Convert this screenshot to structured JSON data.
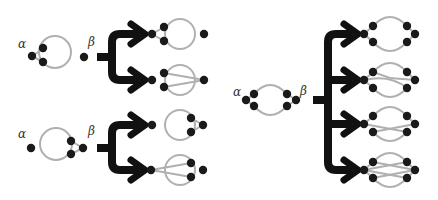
{
  "colors": {
    "background": "#ffffff",
    "node": "#1a1a1a",
    "edge": "#b0b0b0",
    "arrow": "#111111",
    "label": "#333333"
  },
  "labels": {
    "alpha": "α",
    "beta": "β"
  },
  "panels": [
    {
      "id": "top-left",
      "source": {
        "alpha_label": {
          "x": 18,
          "y": 38
        },
        "beta_label": {
          "x": 88,
          "y": 36
        },
        "circles": [
          {
            "cx": 55,
            "cy": 52,
            "r": 16
          }
        ],
        "lines": [
          [
            32,
            56,
            43,
            49
          ],
          [
            32,
            56,
            43,
            62
          ]
        ],
        "nodes": [
          [
            32,
            56
          ],
          [
            43,
            48
          ],
          [
            43,
            62
          ],
          [
            84,
            57
          ]
        ]
      },
      "bracket": {
        "stem_x1": 97,
        "stem_y": 57,
        "vx": 112,
        "y_top": 34,
        "y_bot": 80,
        "arrow_x": 145,
        "targets_y": [
          34,
          80
        ]
      },
      "results": [
        {
          "circles": [
            {
              "cx": 180,
              "cy": 34,
              "r": 15
            }
          ],
          "lines": [
            [
              152,
              34,
              164,
              27
            ],
            [
              152,
              34,
              164,
              41
            ]
          ],
          "nodes": [
            [
              152,
              34
            ],
            [
              164,
              27
            ],
            [
              164,
              41
            ],
            [
              204,
              34
            ]
          ]
        },
        {
          "circles": [
            {
              "cx": 180,
              "cy": 80,
              "r": 15
            }
          ],
          "lines": [
            [
              164,
              73,
              204,
              80
            ],
            [
              164,
              87,
              204,
              80
            ]
          ],
          "nodes": [
            [
              152,
              80
            ],
            [
              164,
              73
            ],
            [
              164,
              87
            ],
            [
              204,
              80
            ]
          ]
        }
      ]
    },
    {
      "id": "bottom-left",
      "source": {
        "alpha_label": {
          "x": 18,
          "y": 130
        },
        "beta_label": {
          "x": 88,
          "y": 128
        },
        "circles": [
          {
            "cx": 56,
            "cy": 144,
            "r": 16
          }
        ],
        "lines": [
          [
            71,
            141,
            83,
            148
          ],
          [
            71,
            154,
            83,
            148
          ]
        ],
        "nodes": [
          [
            31,
            148
          ],
          [
            71,
            141
          ],
          [
            71,
            154
          ],
          [
            83,
            148
          ]
        ]
      },
      "bracket": {
        "stem_x1": 97,
        "stem_y": 148,
        "vx": 112,
        "y_top": 125,
        "y_bot": 170,
        "arrow_x": 145,
        "targets_y": [
          125,
          170
        ]
      },
      "results": [
        {
          "circles": [
            {
              "cx": 180,
              "cy": 125,
              "r": 15
            }
          ],
          "lines": [
            [
              191,
              118,
              203,
              125
            ],
            [
              191,
              132,
              203,
              125
            ]
          ],
          "nodes": [
            [
              152,
              125
            ],
            [
              191,
              118
            ],
            [
              191,
              132
            ],
            [
              203,
              125
            ]
          ]
        },
        {
          "circles": [
            {
              "cx": 180,
              "cy": 170,
              "r": 15
            }
          ],
          "lines": [
            [
              151,
              170,
              191,
              163
            ],
            [
              151,
              170,
              191,
              177
            ]
          ],
          "nodes": [
            [
              151,
              170
            ],
            [
              191,
              163
            ],
            [
              191,
              177
            ],
            [
              203,
              170
            ]
          ]
        }
      ]
    },
    {
      "id": "right",
      "source": {
        "alpha_label": {
          "x": 233,
          "y": 86
        },
        "beta_label": {
          "x": 300,
          "y": 86
        },
        "arcs": [
          "M 254 94 Q 270 76 287 94",
          "M 254 106 Q 270 124 287 106"
        ],
        "lines": [
          [
            246,
            100,
            254,
            94
          ],
          [
            246,
            100,
            254,
            106
          ],
          [
            287,
            94,
            296,
            100
          ],
          [
            287,
            106,
            296,
            100
          ]
        ],
        "nodes": [
          [
            246,
            100
          ],
          [
            254,
            94
          ],
          [
            254,
            106
          ],
          [
            287,
            94
          ],
          [
            287,
            106
          ],
          [
            296,
            100
          ]
        ]
      },
      "bracket": {
        "stem_x1": 313,
        "stem_y": 100,
        "vx": 328,
        "y_top": 34,
        "y_bot": 170,
        "arrow_x": 358,
        "targets_y": [
          34,
          80,
          124,
          170
        ]
      },
      "results": [
        {
          "arcs": [
            "M 373 26 Q 390 8 407 26",
            "M 373 42 Q 390 60 407 42"
          ],
          "lines": [
            [
              364,
              34,
              373,
              26
            ],
            [
              364,
              34,
              373,
              42
            ],
            [
              407,
              26,
              415,
              34
            ],
            [
              407,
              42,
              415,
              34
            ]
          ],
          "nodes": [
            [
              364,
              34
            ],
            [
              373,
              26
            ],
            [
              373,
              42
            ],
            [
              407,
              26
            ],
            [
              407,
              42
            ],
            [
              415,
              34
            ]
          ]
        },
        {
          "arcs": [
            "M 373 72 Q 390 54 407 72",
            "M 364 80 Q 390 74 407 88",
            "M 373 88 Q 390 106 407 88"
          ],
          "lines": [
            [
              364,
              80,
              373,
              72
            ],
            [
              364,
              80,
              373,
              88
            ],
            [
              373,
              72,
              390,
              78
            ],
            [
              390,
              78,
              415,
              80
            ],
            [
              407,
              72,
              415,
              80
            ]
          ],
          "nodes": [
            [
              364,
              80
            ],
            [
              373,
              72
            ],
            [
              373,
              88
            ],
            [
              407,
              72
            ],
            [
              407,
              88
            ],
            [
              415,
              80
            ]
          ]
        },
        {
          "arcs": [
            "M 373 116 Q 390 98 407 116",
            "M 373 132 Q 390 150 407 132"
          ],
          "lines": [
            [
              364,
              124,
              373,
              116
            ],
            [
              364,
              124,
              407,
              132
            ],
            [
              373,
              132,
              415,
              124
            ],
            [
              407,
              116,
              415,
              124
            ]
          ],
          "nodes": [
            [
              364,
              124
            ],
            [
              373,
              116
            ],
            [
              373,
              132
            ],
            [
              407,
              116
            ],
            [
              407,
              132
            ],
            [
              415,
              124
            ]
          ]
        },
        {
          "arcs": [
            "M 373 162 Q 390 144 407 162",
            "M 373 178 Q 390 196 407 178"
          ],
          "lines": [
            [
              364,
              170,
              373,
              162
            ],
            [
              364,
              170,
              373,
              178
            ],
            [
              364,
              170,
              407,
              162
            ],
            [
              364,
              170,
              407,
              178
            ],
            [
              373,
              162,
              415,
              170
            ],
            [
              373,
              178,
              415,
              170
            ],
            [
              407,
              162,
              415,
              170
            ],
            [
              407,
              178,
              415,
              170
            ]
          ],
          "nodes": [
            [
              364,
              170
            ],
            [
              373,
              162
            ],
            [
              373,
              178
            ],
            [
              407,
              162
            ],
            [
              407,
              178
            ],
            [
              415,
              170
            ]
          ]
        }
      ]
    }
  ]
}
